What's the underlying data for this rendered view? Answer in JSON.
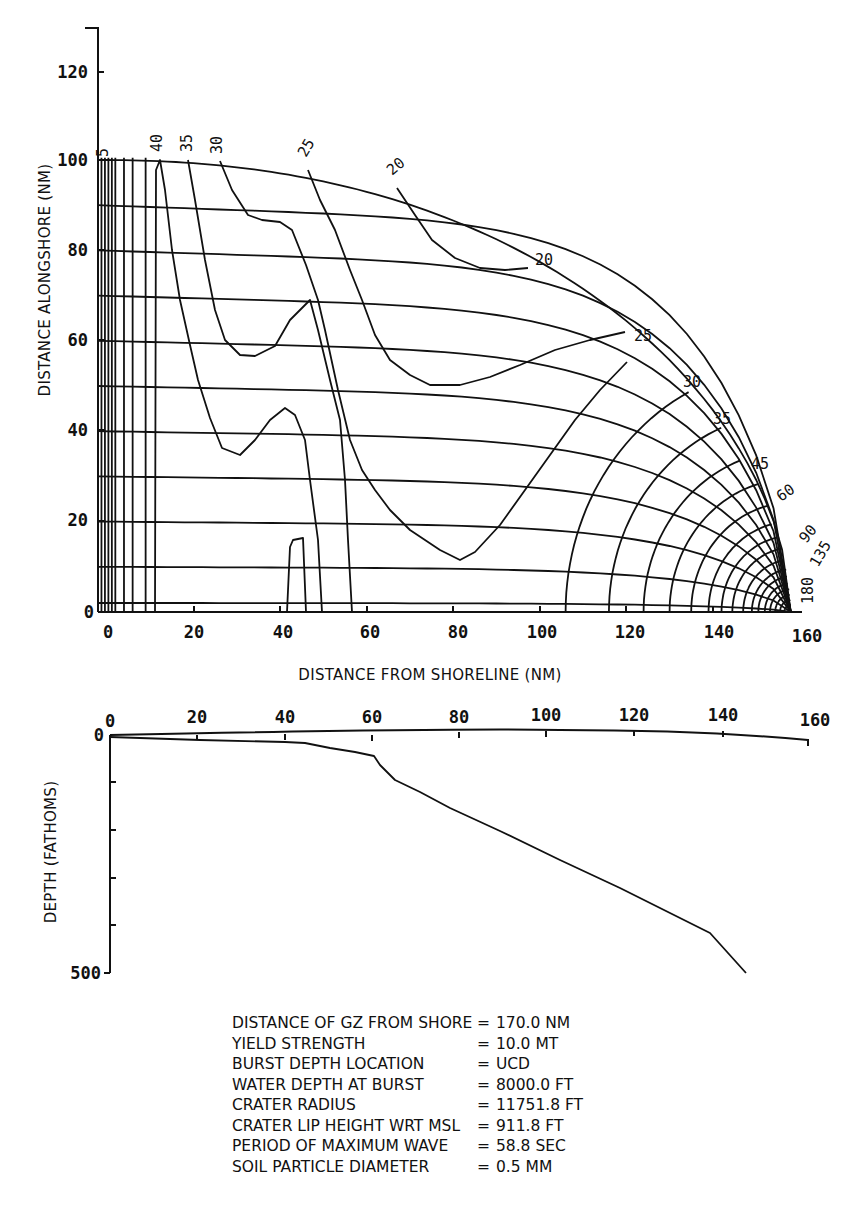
{
  "chart_data": [
    {
      "type": "contour",
      "title": "Wave height contours (refraction diagram) in plan view",
      "xlabel": "DISTANCE FROM SHORELINE (NM)",
      "ylabel": "DISTANCE ALONGSHORE (NM)",
      "xlim": [
        0,
        160
      ],
      "ylim": [
        0,
        130
      ],
      "x_ticks": [
        "0",
        "20",
        "40",
        "60",
        "80",
        "100",
        "120",
        "140",
        "160"
      ],
      "y_ticks": [
        "0",
        "20",
        "40",
        "60",
        "80",
        "100",
        "120"
      ],
      "grid": false,
      "contour_labels_top": [
        "5",
        "40",
        "35",
        "30",
        "25",
        "20"
      ],
      "contour_labels_arc": [
        "20",
        "25",
        "30",
        "35",
        "45",
        "60",
        "90",
        "135",
        "180"
      ],
      "outer_arc": {
        "center": [
          160,
          0
        ],
        "radius_nm": 160
      },
      "series": [
        {
          "name": "contour-40",
          "points": [
            [
              11,
              0
            ],
            [
              11,
              100
            ],
            [
              15,
              80
            ],
            [
              20,
              60
            ],
            [
              25,
              45
            ],
            [
              30,
              37
            ],
            [
              35,
              40
            ],
            [
              40,
              46
            ],
            [
              45,
              38
            ],
            [
              48,
              20
            ],
            [
              51,
              0
            ]
          ]
        },
        {
          "name": "contour-35",
          "points": [
            [
              19,
              100
            ],
            [
              22,
              85
            ],
            [
              27,
              70
            ],
            [
              33,
              64
            ],
            [
              37,
              66
            ],
            [
              40,
              62
            ],
            [
              44,
              54
            ],
            [
              48,
              44
            ],
            [
              52,
              30
            ],
            [
              55,
              14
            ],
            [
              62,
              0
            ]
          ]
        },
        {
          "name": "contour-30",
          "points": [
            [
              30,
              100
            ],
            [
              35,
              90
            ],
            [
              40,
              84
            ],
            [
              45,
              82
            ],
            [
              50,
              80
            ],
            [
              54,
              74
            ],
            [
              58,
              60
            ],
            [
              62,
              46
            ],
            [
              68,
              30
            ],
            [
              75,
              18
            ],
            [
              80,
              13
            ],
            [
              86,
              15
            ],
            [
              95,
              22
            ],
            [
              105,
              32
            ],
            [
              120,
              49
            ]
          ]
        },
        {
          "name": "contour-25",
          "points": [
            [
              47,
              98
            ],
            [
              55,
              88
            ],
            [
              62,
              74
            ],
            [
              68,
              62
            ],
            [
              74,
              54
            ],
            [
              84,
              52
            ],
            [
              95,
              54
            ],
            [
              110,
              58
            ],
            [
              119,
              61
            ]
          ]
        },
        {
          "name": "contour-20",
          "points": [
            [
              65,
              95
            ],
            [
              72,
              88
            ],
            [
              80,
              83
            ],
            [
              90,
              80
            ],
            [
              100,
              79
            ]
          ]
        },
        {
          "name": "contour-bump",
          "points": [
            [
              41,
              0
            ],
            [
              42,
              16
            ],
            [
              45,
              17
            ],
            [
              46,
              0
            ]
          ]
        }
      ]
    },
    {
      "type": "line",
      "title": "Bathymetric profile",
      "xlabel": "",
      "ylabel": "DEPTH (FATHOMS)",
      "xlim": [
        0,
        160
      ],
      "ylim": [
        0,
        500
      ],
      "x_ticks": [
        "0",
        "20",
        "40",
        "60",
        "80",
        "100",
        "120",
        "140",
        "160"
      ],
      "y_ticks": [
        "0",
        "500"
      ],
      "y_inverted": true,
      "series": [
        {
          "name": "depth-profile",
          "x": [
            0,
            20,
            40,
            46,
            61,
            66,
            80,
            100,
            120,
            140,
            146
          ],
          "y": [
            2,
            6,
            10,
            12,
            40,
            90,
            160,
            250,
            345,
            440,
            500
          ]
        }
      ]
    }
  ],
  "top_chart": {
    "ylabel": "DISTANCE ALONGSHORE (NM)",
    "xlabel": "DISTANCE FROM SHORELINE (NM)",
    "origin_x_label": "0",
    "origin_y_label": "0",
    "x_ticks": [
      "20",
      "40",
      "60",
      "80",
      "100",
      "120",
      "140",
      "160"
    ],
    "y_ticks": [
      "20",
      "40",
      "60",
      "80",
      "100",
      "120"
    ],
    "top_labels": [
      "5",
      "40",
      "35",
      "30",
      "25",
      "20"
    ],
    "arc_labels": [
      "20",
      "25",
      "30",
      "35",
      "45",
      "60",
      "90",
      "135",
      "180"
    ]
  },
  "depth_chart": {
    "ylabel": "DEPTH (FATHOMS)",
    "origin_x_label": "0",
    "origin_y_label": "0",
    "bottom_y_label": "500",
    "x_ticks": [
      "20",
      "40",
      "60",
      "80",
      "100",
      "120",
      "140",
      "160"
    ]
  },
  "parameters": [
    {
      "name": "DISTANCE OF GZ FROM SHORE",
      "value": "170.0 NM"
    },
    {
      "name": "YIELD STRENGTH",
      "value": "10.0 MT"
    },
    {
      "name": "BURST DEPTH LOCATION",
      "value": "UCD"
    },
    {
      "name": "WATER DEPTH AT BURST",
      "value": "8000.0 FT"
    },
    {
      "name": "CRATER RADIUS",
      "value": "11751.8 FT"
    },
    {
      "name": "CRATER LIP HEIGHT WRT MSL",
      "value": "911.8 FT"
    },
    {
      "name": "PERIOD OF MAXIMUM WAVE",
      "value": "58.8 SEC"
    },
    {
      "name": "SOIL PARTICLE DIAMETER",
      "value": "0.5 MM"
    }
  ],
  "equals_sign": "="
}
